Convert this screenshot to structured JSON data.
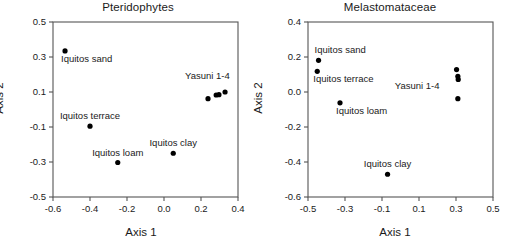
{
  "figure": {
    "background": "#ffffff",
    "marker_color": "#000000",
    "axis_color": "#555555",
    "text_color": "#1a1a1a"
  },
  "panels": [
    {
      "id": "pteridophytes",
      "title": "Pteridophytes",
      "xlabel": "Axis 1",
      "ylabel": "Axis 2",
      "xticks": [
        "-0.6",
        "-0.4",
        "-0.2",
        "0.0",
        "0.2",
        "0.4"
      ],
      "yticks": [
        "0.5",
        "0.3",
        "0.1",
        "-0.1",
        "-0.3",
        "-0.5"
      ]
    },
    {
      "id": "melastomataceae",
      "title": "Melastomataceae",
      "xlabel": "Axis 1",
      "ylabel": "Axis 2",
      "xticks": [
        "-0.5",
        "-0.3",
        "-0.1",
        "0.1",
        "0.3",
        "0.5"
      ],
      "yticks": [
        "0.4",
        "0.2",
        "0.0",
        "-0.2",
        "-0.4",
        "-0.6"
      ]
    }
  ],
  "chart_data": [
    {
      "type": "scatter",
      "title": "Pteridophytes",
      "xlabel": "Axis 1",
      "ylabel": "Axis 2",
      "xlim": [
        -0.6,
        0.4
      ],
      "ylim": [
        -0.5,
        0.5
      ],
      "xticks": [
        -0.6,
        -0.4,
        -0.2,
        0.0,
        0.2,
        0.4
      ],
      "yticks": [
        0.5,
        0.3,
        0.1,
        -0.1,
        -0.3,
        -0.5
      ],
      "grid": false,
      "legend": "none",
      "points": [
        {
          "label": "Iquitos sand",
          "x": -0.535,
          "y": 0.335,
          "label_pos": "below-right"
        },
        {
          "label": "Iquitos terrace",
          "x": -0.4,
          "y": -0.095,
          "label_pos": "above"
        },
        {
          "label": "Iquitos loam",
          "x": -0.25,
          "y": -0.303,
          "label_pos": "above"
        },
        {
          "label": "Iquitos clay",
          "x": 0.05,
          "y": -0.25,
          "label_pos": "above"
        },
        {
          "label": "Yasuni 1",
          "x": 0.238,
          "y": 0.062,
          "label_pos": "none"
        },
        {
          "label": "Yasuni 2",
          "x": 0.282,
          "y": 0.083,
          "label_pos": "none"
        },
        {
          "label": "Yasuni 3",
          "x": 0.297,
          "y": 0.085,
          "label_pos": "none"
        },
        {
          "label": "Yasuni 4",
          "x": 0.33,
          "y": 0.1,
          "label_pos": "none"
        }
      ],
      "annotations": [
        {
          "text": "Yasuni 1-4",
          "x": 0.235,
          "y": 0.175
        }
      ]
    },
    {
      "type": "scatter",
      "title": "Melastomataceae",
      "xlabel": "Axis 1",
      "ylabel": "Axis 2",
      "xlim": [
        -0.5,
        0.5
      ],
      "ylim": [
        -0.6,
        0.4
      ],
      "xticks": [
        -0.5,
        -0.3,
        -0.1,
        0.1,
        0.3,
        0.5
      ],
      "yticks": [
        0.4,
        0.2,
        0.0,
        -0.2,
        -0.4,
        -0.6
      ],
      "grid": false,
      "legend": "none",
      "points": [
        {
          "label": "Iquitos sand",
          "x": -0.443,
          "y": 0.181,
          "label_pos": "above-right"
        },
        {
          "label": "Iquitos terrace",
          "x": -0.45,
          "y": 0.118,
          "label_pos": "below-right"
        },
        {
          "label": "Iquitos loam",
          "x": -0.327,
          "y": -0.062,
          "label_pos": "below-right"
        },
        {
          "label": "Iquitos clay",
          "x": -0.07,
          "y": -0.47,
          "label_pos": "above"
        },
        {
          "label": "Yasuni 1",
          "x": 0.303,
          "y": 0.128,
          "label_pos": "none"
        },
        {
          "label": "Yasuni 2",
          "x": 0.31,
          "y": 0.09,
          "label_pos": "none"
        },
        {
          "label": "Yasuni 3",
          "x": 0.312,
          "y": 0.072,
          "label_pos": "none"
        },
        {
          "label": "Yasuni 4",
          "x": 0.31,
          "y": -0.038,
          "label_pos": "none"
        }
      ],
      "annotations": [
        {
          "text": "Yasuni 1-4",
          "x": 0.09,
          "y": 0.02
        }
      ]
    }
  ]
}
